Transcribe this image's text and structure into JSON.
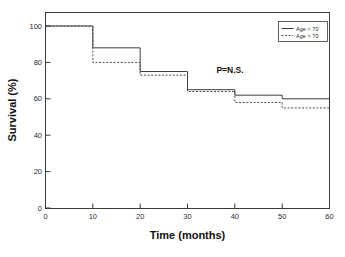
{
  "chart_data": {
    "type": "line",
    "subtype": "kaplan-meier-step",
    "title": "",
    "xlabel": "Time (months)",
    "ylabel": "Survival (%)",
    "xlim": [
      0,
      60
    ],
    "ylim": [
      0,
      100
    ],
    "xticks": [
      0,
      10,
      20,
      30,
      40,
      50,
      60
    ],
    "yticks": [
      0,
      20,
      40,
      60,
      80,
      100
    ],
    "xticklabels": [
      "0",
      "10",
      "20",
      "30",
      "40",
      "50",
      "60"
    ],
    "yticklabels": [
      "0",
      "20",
      "40",
      "60",
      "80",
      "100"
    ],
    "grid": false,
    "legend_position": "top-right",
    "x": [
      0,
      10,
      20,
      30,
      40,
      50,
      60
    ],
    "series": [
      {
        "name": "Age < 70",
        "style": "solid",
        "color": "#3d3d3d",
        "values": [
          100,
          88,
          75,
          65,
          62,
          60,
          60
        ]
      },
      {
        "name": "Age > 70",
        "style": "dashed",
        "color": "#4a4a4a",
        "values": [
          100,
          80,
          73,
          64,
          58,
          55,
          55
        ]
      }
    ],
    "annotations": [
      {
        "text": "P=N.S.",
        "x": 38,
        "y": 80
      }
    ]
  },
  "axes": {
    "x_title": "Time (months)",
    "y_title": "Survival (%)",
    "x_tick_labels": [
      "0",
      "10",
      "20",
      "30",
      "40",
      "50",
      "60"
    ],
    "y_tick_labels": [
      "0",
      "20",
      "40",
      "60",
      "80",
      "100"
    ]
  },
  "legend": {
    "entries": [
      {
        "label": "Age < 70"
      },
      {
        "label": "Age > 70"
      }
    ]
  },
  "annotation": {
    "significance": "P=N.S."
  },
  "colors": {
    "background": "#ffffff",
    "axis": "#3a3a3a",
    "series_solid": "#3d3d3d",
    "series_dashed": "#4a4a4a",
    "text": "#1a1a1a"
  }
}
